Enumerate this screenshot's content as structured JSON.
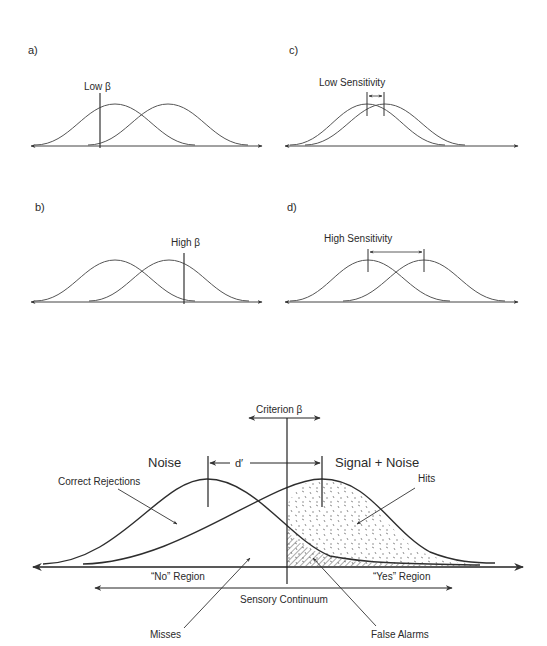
{
  "panels": {
    "a": {
      "label": "a)",
      "annotation": "Low β"
    },
    "b": {
      "label": "b)",
      "annotation": "High β"
    },
    "c": {
      "label": "c)",
      "annotation": "Low Sensitivity"
    },
    "d": {
      "label": "d)",
      "annotation": "High Sensitivity"
    }
  },
  "main": {
    "criterion": "Criterion β",
    "noise": "Noise",
    "signal_noise": "Signal + Noise",
    "dprime": "d′",
    "correct_rejections": "Correct Rejections",
    "hits": "Hits",
    "no_region": "“No” Region",
    "yes_region": "“Yes” Region",
    "sensory_continuum": "Sensory Continuum",
    "misses": "Misses",
    "false_alarms": "False Alarms"
  },
  "colors": {
    "line": "#3a3a3a",
    "text": "#2a2a2a",
    "background": "#ffffff"
  }
}
